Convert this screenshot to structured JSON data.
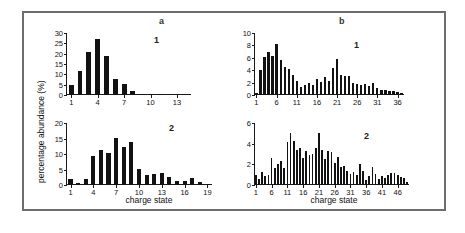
{
  "figure": {
    "panel_a_letter": "a",
    "panel_b_letter": "b",
    "ylabel": "percentage abundance (%)",
    "xtitle_left": "charge state",
    "xtitle_right": "charge state",
    "index_a1": "1",
    "index_a2": "2",
    "index_b1": "1",
    "index_b2": "2",
    "bar_color": "#121212",
    "axis_color": "#1a1a1a",
    "frame_color": "#6d6d6d"
  },
  "chart_data": [
    {
      "type": "bar",
      "id": "a1",
      "title": "a",
      "annotation": "1",
      "xlabel": "charge state",
      "ylabel": "percentage abundance (%)",
      "ylim": [
        0,
        30
      ],
      "yticks": [
        0,
        5,
        10,
        15,
        20,
        25,
        30
      ],
      "xlim": [
        0.4,
        14.6
      ],
      "xticks": [
        1,
        4,
        7,
        10,
        13
      ],
      "grid": false,
      "categories": [
        1,
        2,
        3,
        4,
        5,
        6,
        7,
        8,
        9,
        10,
        11
      ],
      "values": [
        5.0,
        11.7,
        21.0,
        27.0,
        18.7,
        7.7,
        5.4,
        2.0,
        0.7,
        0.4,
        0.3
      ]
    },
    {
      "type": "bar",
      "id": "a2",
      "title": "a",
      "annotation": "2",
      "xlabel": "charge state",
      "ylabel": "percentage abundance (%)",
      "ylim": [
        0,
        20
      ],
      "yticks": [
        0,
        5,
        10,
        15,
        20
      ],
      "xlim": [
        0.4,
        19.6
      ],
      "xticks": [
        1,
        4,
        7,
        10,
        13,
        16,
        19
      ],
      "grid": false,
      "categories": [
        1,
        2,
        3,
        4,
        5,
        6,
        7,
        8,
        9,
        10,
        11,
        12,
        13,
        14,
        15,
        16,
        17,
        18,
        19
      ],
      "values": [
        2.0,
        0.8,
        2.1,
        9.3,
        11.3,
        10.2,
        15.2,
        12.2,
        14.0,
        5.2,
        3.3,
        3.4,
        4.0,
        2.5,
        1.3,
        1.3,
        2.4,
        0.9,
        0.3
      ]
    },
    {
      "type": "bar",
      "id": "b1",
      "title": "b",
      "annotation": "1",
      "xlabel": "charge state",
      "ylabel": "percentage abundance (%)",
      "ylim": [
        0,
        10
      ],
      "yticks": [
        0,
        2,
        4,
        6,
        8,
        10
      ],
      "xlim": [
        0.4,
        37.6
      ],
      "xticks": [
        1,
        6,
        11,
        16,
        21,
        26,
        31,
        36
      ],
      "grid": false,
      "categories": [
        1,
        2,
        3,
        4,
        5,
        6,
        7,
        8,
        9,
        10,
        11,
        12,
        13,
        14,
        15,
        16,
        17,
        18,
        19,
        20,
        21,
        22,
        23,
        24,
        25,
        26,
        27,
        28,
        29,
        30,
        31,
        32,
        33,
        34,
        35,
        36,
        37
      ],
      "values": [
        0.4,
        4.0,
        6.1,
        6.9,
        6.3,
        8.2,
        5.7,
        4.5,
        4.2,
        3.2,
        2.2,
        1.3,
        1.6,
        2.0,
        1.6,
        2.6,
        2.1,
        2.9,
        2.3,
        4.4,
        5.8,
        3.2,
        3.0,
        3.0,
        1.9,
        1.8,
        1.6,
        1.8,
        1.5,
        1.9,
        1.2,
        0.8,
        0.8,
        0.7,
        0.6,
        0.5,
        0.4
      ]
    },
    {
      "type": "bar",
      "id": "b2",
      "title": "b",
      "annotation": "2",
      "xlabel": "charge state",
      "ylabel": "percentage abundance (%)",
      "ylim": [
        0,
        6
      ],
      "yticks": [
        0,
        2,
        4,
        6
      ],
      "xlim": [
        0.4,
        49.6
      ],
      "xticks": [
        1,
        6,
        11,
        16,
        21,
        26,
        31,
        36,
        41,
        46
      ],
      "grid": false,
      "categories": [
        1,
        2,
        3,
        4,
        5,
        6,
        7,
        8,
        9,
        10,
        11,
        12,
        13,
        14,
        15,
        16,
        17,
        18,
        19,
        20,
        21,
        22,
        23,
        24,
        25,
        26,
        27,
        28,
        29,
        30,
        31,
        32,
        33,
        34,
        35,
        36,
        37,
        38,
        39,
        40,
        41,
        42,
        43,
        44,
        45,
        46,
        47,
        48,
        49
      ],
      "values": [
        1.0,
        0.6,
        1.3,
        0.9,
        1.0,
        2.6,
        1.6,
        2.0,
        2.3,
        1.6,
        4.2,
        5.0,
        4.3,
        3.4,
        3.6,
        2.6,
        3.3,
        2.9,
        3.0,
        3.6,
        5.0,
        3.4,
        2.5,
        3.3,
        3.2,
        2.1,
        2.7,
        1.7,
        1.8,
        1.4,
        1.1,
        1.3,
        1.0,
        2.0,
        1.4,
        0.5,
        0.9,
        1.7,
        1.1,
        0.6,
        0.9,
        0.7,
        1.0,
        1.2,
        1.2,
        1.0,
        0.8,
        0.7,
        0.3
      ]
    }
  ]
}
